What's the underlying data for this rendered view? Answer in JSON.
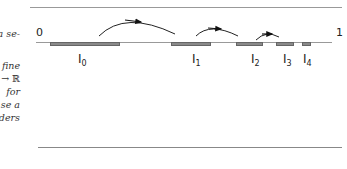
{
  "text_fragments": [
    "a se-",
    "fine",
    "→ ℝ",
    "for",
    "se a",
    "iders"
  ],
  "figure": {
    "axis_start_label": "0",
    "axis_end_label": "1",
    "intervals": [
      {
        "name": "I",
        "sub": "0"
      },
      {
        "name": "I",
        "sub": "1"
      },
      {
        "name": "I",
        "sub": "2"
      },
      {
        "name": "I",
        "sub": "3"
      },
      {
        "name": "I",
        "sub": "4"
      }
    ]
  }
}
